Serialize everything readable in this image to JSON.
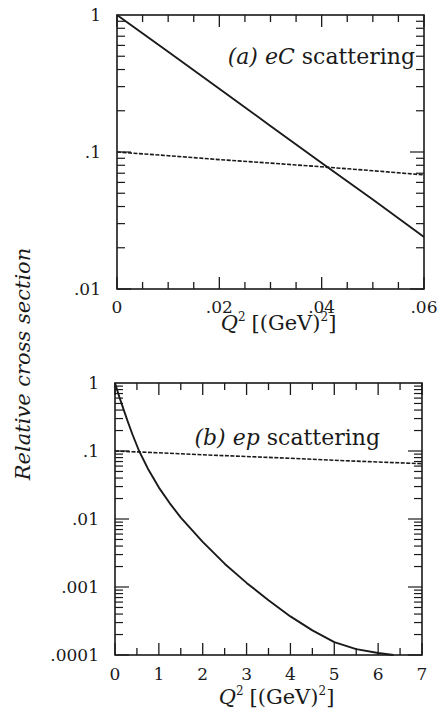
{
  "figure": {
    "ylabel": "Relative cross section",
    "colors": {
      "ink": "#1a1a1a",
      "background": "#ffffff"
    }
  },
  "chart_data": [
    {
      "type": "line",
      "panel": "a",
      "title": "(a) eC scattering",
      "title_parts": {
        "tag": "(a)",
        "process": "eC",
        "word": "scattering"
      },
      "xlabel": "Q^2 [(GeV)^2]",
      "ylabel": "Relative cross section",
      "xscale": "linear",
      "yscale": "log",
      "xlim": [
        0,
        0.06
      ],
      "ylim": [
        0.01,
        1
      ],
      "xticks": [
        0,
        0.02,
        0.04,
        0.06
      ],
      "xtick_labels": [
        "0",
        ".02",
        ".04",
        ".06"
      ],
      "x_minor_step": 0.005,
      "yticks": [
        0.01,
        0.1,
        1
      ],
      "ytick_labels": [
        ".01",
        ".1",
        "1"
      ],
      "grid": false,
      "series": [
        {
          "name": "solid",
          "style": "solid",
          "x": [
            0,
            0.01,
            0.02,
            0.03,
            0.04,
            0.05,
            0.06
          ],
          "y": [
            1.0,
            0.54,
            0.29,
            0.155,
            0.083,
            0.045,
            0.024
          ]
        },
        {
          "name": "dashed",
          "style": "dashed",
          "x": [
            0,
            0.01,
            0.02,
            0.03,
            0.04,
            0.05,
            0.06
          ],
          "y": [
            0.1,
            0.094,
            0.088,
            0.083,
            0.078,
            0.073,
            0.068
          ]
        }
      ]
    },
    {
      "type": "line",
      "panel": "b",
      "title": "(b) ep scattering",
      "title_parts": {
        "tag": "(b)",
        "process": "ep",
        "word": "scattering"
      },
      "xlabel": "Q^2 [(GeV)^2]",
      "ylabel": "Relative cross section",
      "xscale": "linear",
      "yscale": "log",
      "xlim": [
        0,
        7
      ],
      "ylim": [
        0.0001,
        1
      ],
      "xticks": [
        0,
        1,
        2,
        3,
        4,
        5,
        6,
        7
      ],
      "xtick_labels": [
        "0",
        "1",
        "2",
        "3",
        "4",
        "5",
        "6",
        "7"
      ],
      "x_minor_step": 0.5,
      "yticks": [
        0.0001,
        0.001,
        0.01,
        0.1,
        1
      ],
      "ytick_labels": [
        ".0001",
        ".001",
        ".01",
        ".1",
        "1"
      ],
      "grid": false,
      "series": [
        {
          "name": "solid",
          "style": "solid",
          "x": [
            0,
            0.1,
            0.2,
            0.3,
            0.4,
            0.55,
            0.75,
            1.0,
            1.25,
            1.5,
            2.0,
            2.5,
            3.0,
            3.5,
            4.0,
            4.5,
            5.0,
            5.5,
            6.0,
            6.35
          ],
          "y": [
            1.0,
            0.62,
            0.4,
            0.26,
            0.175,
            0.1,
            0.055,
            0.029,
            0.017,
            0.0105,
            0.0046,
            0.0022,
            0.00115,
            0.00064,
            0.00037,
            0.00023,
            0.000155,
            0.000122,
            0.000107,
            0.0001
          ]
        },
        {
          "name": "dashed",
          "style": "dashed",
          "x": [
            0,
            1,
            2,
            3,
            4,
            5,
            6,
            7
          ],
          "y": [
            0.1,
            0.094,
            0.088,
            0.083,
            0.078,
            0.073,
            0.069,
            0.065
          ]
        }
      ]
    }
  ]
}
